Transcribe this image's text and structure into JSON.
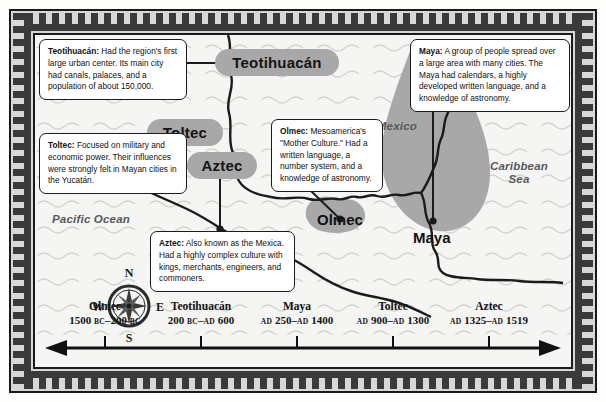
{
  "map": {
    "ocean_labels": [
      {
        "name": "pacific",
        "text": "Pacific Ocean"
      },
      {
        "name": "gulf",
        "text": "Gulf of Mexico"
      },
      {
        "name": "caribbean",
        "text": "Caribbean\nSea"
      }
    ],
    "culture_labels": [
      {
        "name": "teotihuacan",
        "text": "Teotihuacán"
      },
      {
        "name": "toltec",
        "text": "Toltec"
      },
      {
        "name": "aztec",
        "text": "Aztec"
      },
      {
        "name": "olmec",
        "text": "Olmec"
      },
      {
        "name": "maya",
        "text": "Maya"
      }
    ],
    "compass": {
      "north": "N",
      "east": "E",
      "south": "S",
      "west": "W"
    }
  },
  "callouts": [
    {
      "name": "teotihuacan",
      "title": "Teotihuacán:",
      "body": " Had the region's first large urban center. Its main city had canals, palaces, and a population of about 150,000."
    },
    {
      "name": "toltec",
      "title": "Toltec:",
      "body": " Focused on military and economic power. Their influences were strongly felt in Mayan cities in the Yucatán."
    },
    {
      "name": "aztec",
      "title": "Aztec:",
      "body": " Also known as the Mexica. Had a highly complex culture with kings, merchants, engineers, and commoners."
    },
    {
      "name": "olmec",
      "title": "Olmec:",
      "body": " Mesoamerica's \"Mother Culture.\" Had a written language, a number system, and a knowledge of astronomy."
    },
    {
      "name": "maya",
      "title": "Maya:",
      "body": " A group of people spread over a large area with many cities. The Maya had calendars, a highly developed written language, and a knowledge of astronomy."
    }
  ],
  "chart_data": {
    "type": "table",
    "xlabel": "",
    "ylabel": "",
    "categories": [
      "Olmec",
      "Teotihuacán",
      "Maya",
      "Toltec",
      "Aztec"
    ],
    "entries": [
      {
        "name": "Olmec",
        "range": "1500 BC–200 BC",
        "start_text": "1500",
        "start_era": "BC",
        "end_text": "200",
        "end_era": "BC",
        "start_year": -1500,
        "end_year": -200
      },
      {
        "name": "Teotihuacán",
        "range": "200 BC–AD 600",
        "start_text": "200",
        "start_era": "BC",
        "end_text": "600",
        "end_era": "AD",
        "start_year": -200,
        "end_year": 600
      },
      {
        "name": "Maya",
        "range": "AD 250–AD 1400",
        "start_text": "250",
        "start_era": "AD",
        "end_text": "1400",
        "end_era": "AD",
        "start_year": 250,
        "end_year": 1400
      },
      {
        "name": "Toltec",
        "range": "AD 900–AD 1300",
        "start_text": "900",
        "start_era": "AD",
        "end_text": "1300",
        "end_era": "AD",
        "start_year": 900,
        "end_year": 1300
      },
      {
        "name": "Aztec",
        "range": "AD 1325–AD 1519",
        "start_text": "1325",
        "start_era": "AD",
        "end_text": "1519",
        "end_era": "AD",
        "start_year": 1325,
        "end_year": 1519
      }
    ]
  },
  "colors": {
    "region_fill": "#a8a8a8",
    "border_dark": "#3a3a3a",
    "frame_bg": "#d8d8d8",
    "map_bg": "#f5f5f3",
    "ink": "#111111",
    "ocean_text": "#55585c"
  }
}
